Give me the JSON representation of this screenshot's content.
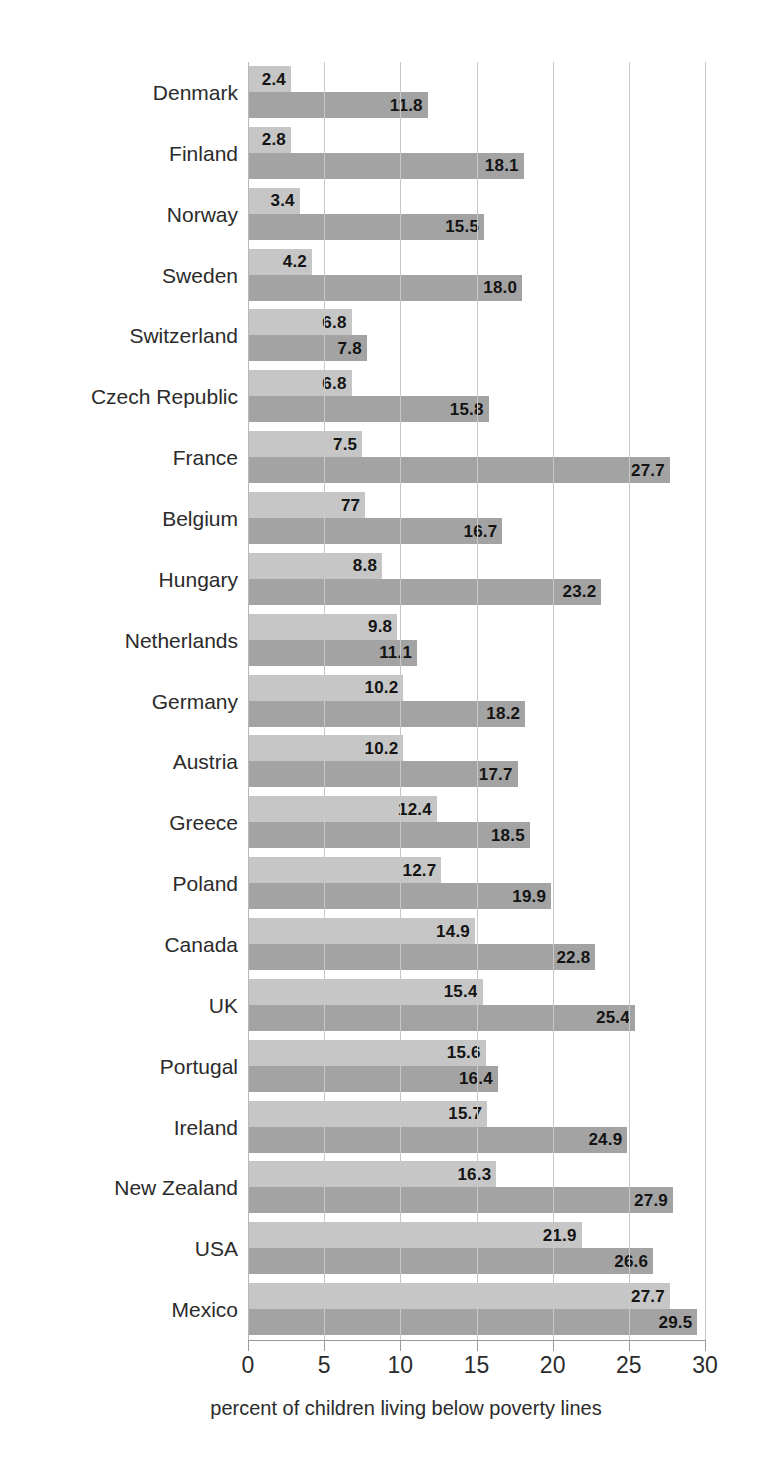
{
  "chart_data": {
    "type": "bar",
    "orientation": "horizontal",
    "title": "",
    "subtitle": "",
    "xlabel": "percent of children living below poverty lines",
    "ylabel": "",
    "xlim": [
      0,
      30
    ],
    "xticks": [
      0,
      5,
      10,
      15,
      20,
      25,
      30
    ],
    "xtick_labels": [
      "0",
      "5",
      "10",
      "15",
      "20",
      "25",
      "30"
    ],
    "grid": true,
    "grid_axis": "x",
    "legend": false,
    "legend_position": "none",
    "categories": [
      "Denmark",
      "Finland",
      "Norway",
      "Sweden",
      "Switzerland",
      "Czech Republic",
      "France",
      "Belgium",
      "Hungary",
      "Netherlands",
      "Germany",
      "Austria",
      "Greece",
      "Poland",
      "Canada",
      "UK",
      "Portugal",
      "Ireland",
      "New Zealand",
      "USA",
      "Mexico"
    ],
    "series": [
      {
        "name": "light",
        "color": "#c6c6c6",
        "values": [
          2.4,
          2.8,
          3.4,
          4.2,
          6.8,
          6.8,
          7.5,
          7.7,
          8.8,
          9.8,
          10.2,
          10.2,
          12.4,
          12.7,
          14.9,
          15.4,
          15.6,
          15.7,
          16.3,
          21.9,
          27.7
        ],
        "labels": [
          "2.4",
          "2.8",
          "3.4",
          "4.2",
          "6.8",
          "6.8",
          "7.5",
          "77",
          "8.8",
          "9.8",
          "10.2",
          "10.2",
          "12.4",
          "12.7",
          "14.9",
          "15.4",
          "15.6",
          "15.7",
          "16.3",
          "21.9",
          "27.7"
        ]
      },
      {
        "name": "dark",
        "color": "#a3a3a3",
        "values": [
          11.8,
          18.1,
          15.5,
          18.0,
          7.8,
          15.8,
          27.7,
          16.7,
          23.2,
          11.1,
          18.2,
          17.7,
          18.5,
          19.9,
          22.8,
          25.4,
          16.4,
          24.9,
          27.9,
          26.6,
          29.5
        ],
        "labels": [
          "11.8",
          "18.1",
          "15.5",
          "18.0",
          "7.8",
          "15.8",
          "27.7",
          "16.7",
          "23.2",
          "11.1",
          "18.2",
          "17.7",
          "18.5",
          "19.9",
          "22.8",
          "25.4",
          "16.4",
          "24.9",
          "27.9",
          "26.6",
          "29.5"
        ]
      }
    ]
  }
}
